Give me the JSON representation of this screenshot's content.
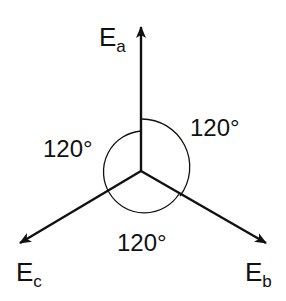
{
  "diagram": {
    "colors": {
      "line": "#111111",
      "background": "#ffffff"
    },
    "phasors": [
      {
        "name": "E",
        "subscript": "a",
        "angle_deg": 90
      },
      {
        "name": "E",
        "subscript": "b",
        "angle_deg": -30
      },
      {
        "name": "E",
        "subscript": "c",
        "angle_deg": 210
      }
    ],
    "angles": [
      {
        "label": "120°",
        "between": "Ea-Eb"
      },
      {
        "label": "120°",
        "between": "Ec-Ea"
      },
      {
        "label": "120°",
        "between": "Eb-Ec"
      }
    ]
  }
}
